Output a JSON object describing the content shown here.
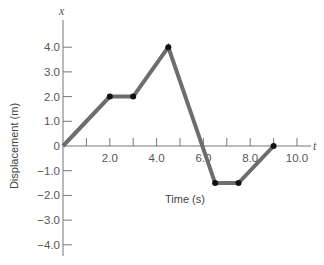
{
  "chart_data": {
    "type": "line",
    "title": "",
    "xlabel": "Time (s)",
    "ylabel": "Displacement (m)",
    "x_axis_var": "t",
    "y_axis_var": "x",
    "xlim": [
      0,
      10.5
    ],
    "ylim": [
      -4.5,
      5.0
    ],
    "x_ticks": [
      1,
      2,
      3,
      4,
      5,
      6,
      7,
      8,
      9,
      10
    ],
    "x_tick_labels": [
      "2.0",
      "4.0",
      "6.0",
      "8.0",
      "10.0"
    ],
    "y_tick_labels": [
      "4.0",
      "3.0",
      "2.0",
      "1.0",
      "0",
      "−1.0",
      "−2.0",
      "−3.0",
      "−4.0"
    ],
    "grid": false,
    "legend": null,
    "series": [
      {
        "name": "displacement",
        "color": "#6d6d6d",
        "x": [
          0,
          2.0,
          3.0,
          4.5,
          6.5,
          7.5,
          9.0
        ],
        "y": [
          0,
          2.0,
          2.0,
          4.0,
          -1.5,
          -1.5,
          0
        ],
        "markers_at": [
          1,
          2,
          3,
          4,
          5,
          6
        ]
      }
    ]
  }
}
